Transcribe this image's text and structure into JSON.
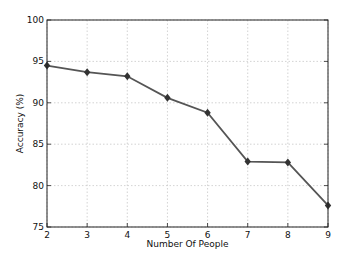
{
  "chart_data": {
    "type": "line",
    "title": "",
    "xlabel": "Number Of People",
    "ylabel": "Accuracy (%)",
    "x": [
      2,
      3,
      4,
      5,
      6,
      7,
      8,
      9
    ],
    "series": [
      {
        "name": "Accuracy",
        "values": [
          94.5,
          93.7,
          93.2,
          90.6,
          88.8,
          82.9,
          82.8,
          77.6
        ],
        "color": "#555555",
        "marker": "diamond",
        "marker_color": "#333333"
      }
    ],
    "xlim": [
      2,
      9
    ],
    "ylim": [
      75,
      100
    ],
    "xticks": [
      2,
      3,
      4,
      5,
      6,
      7,
      8,
      9
    ],
    "yticks": [
      75,
      80,
      85,
      90,
      95,
      100
    ],
    "grid": true,
    "legend": null
  }
}
